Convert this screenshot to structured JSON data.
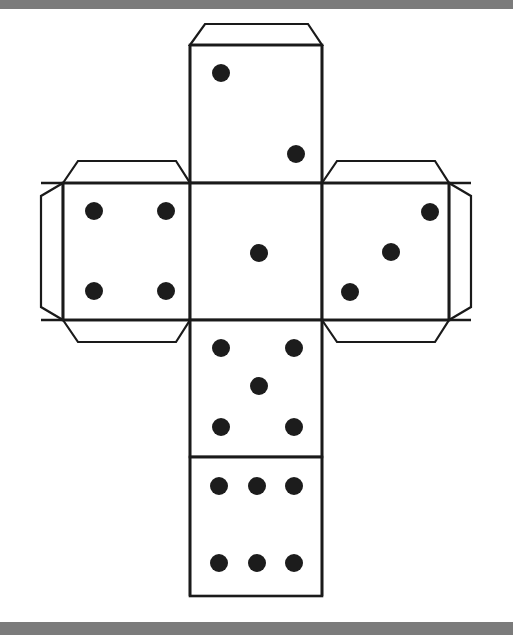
{
  "page": {
    "background_color": "#ffffff",
    "scan_bar_color": "#7b7b7b",
    "ink_color": "#1a1a1a",
    "pip_color": "#1c1c1c",
    "width": 513,
    "height": 635
  },
  "net": {
    "shape": "cube-net-cross",
    "layout": "vertical-column-of-four-with-two-side-faces",
    "stroke_width": 2.4,
    "faces": [
      {
        "id": "face-top",
        "name": "top-face",
        "pip_count": 2,
        "x": 190,
        "y": 45,
        "width": 132,
        "height": 138,
        "pips": [
          {
            "cx": 221,
            "cy": 73,
            "r": 9
          },
          {
            "cx": 296,
            "cy": 154,
            "r": 9
          }
        ]
      },
      {
        "id": "face-left",
        "name": "left-face",
        "pip_count": 4,
        "x": 63,
        "y": 183,
        "width": 127,
        "height": 137,
        "pips": [
          {
            "cx": 94,
            "cy": 211,
            "r": 9
          },
          {
            "cx": 166,
            "cy": 211,
            "r": 9
          },
          {
            "cx": 94,
            "cy": 291,
            "r": 9
          },
          {
            "cx": 166,
            "cy": 291,
            "r": 9
          }
        ]
      },
      {
        "id": "face-center",
        "name": "center-face",
        "pip_count": 1,
        "x": 190,
        "y": 183,
        "width": 132,
        "height": 137,
        "pips": [
          {
            "cx": 259,
            "cy": 253,
            "r": 9
          }
        ]
      },
      {
        "id": "face-right",
        "name": "right-face",
        "pip_count": 3,
        "x": 322,
        "y": 183,
        "width": 127,
        "height": 137,
        "pips": [
          {
            "cx": 430,
            "cy": 212,
            "r": 9
          },
          {
            "cx": 391,
            "cy": 252,
            "r": 9
          },
          {
            "cx": 350,
            "cy": 292,
            "r": 9
          }
        ]
      },
      {
        "id": "face-bottom-five",
        "name": "five-face",
        "pip_count": 5,
        "x": 190,
        "y": 320,
        "width": 132,
        "height": 137,
        "pips": [
          {
            "cx": 221,
            "cy": 348,
            "r": 9
          },
          {
            "cx": 294,
            "cy": 348,
            "r": 9
          },
          {
            "cx": 259,
            "cy": 386,
            "r": 9
          },
          {
            "cx": 221,
            "cy": 427,
            "r": 9
          },
          {
            "cx": 294,
            "cy": 427,
            "r": 9
          }
        ]
      },
      {
        "id": "face-bottom-six",
        "name": "six-face",
        "pip_count": 6,
        "x": 190,
        "y": 457,
        "width": 132,
        "height": 139,
        "pips": [
          {
            "cx": 219,
            "cy": 486,
            "r": 9
          },
          {
            "cx": 257,
            "cy": 486,
            "r": 9
          },
          {
            "cx": 294,
            "cy": 486,
            "r": 9
          },
          {
            "cx": 219,
            "cy": 563,
            "r": 9
          },
          {
            "cx": 257,
            "cy": 563,
            "r": 9
          },
          {
            "cx": 294,
            "cy": 563,
            "r": 9
          }
        ]
      }
    ],
    "flaps": [
      {
        "id": "flap-top",
        "name": "glue-flap-top",
        "points": "190,45 205,24 308,24 322,45"
      },
      {
        "id": "flap-left-top",
        "name": "glue-flap-left-top",
        "points": "63,183 78,161 176,161 190,183"
      },
      {
        "id": "flap-left-outer",
        "name": "glue-flap-left-outer",
        "points": "63,183 41,196 41,307 63,320"
      },
      {
        "id": "flap-left-bottom",
        "name": "glue-flap-left-bottom",
        "points": "63,320 78,342 176,342 190,320"
      },
      {
        "id": "flap-right-top",
        "name": "glue-flap-right-top",
        "points": "322,183 337,161 435,161 449,183"
      },
      {
        "id": "flap-right-outer",
        "name": "glue-flap-right-outer",
        "points": "449,183 471,196 471,307 449,320"
      },
      {
        "id": "flap-right-bottom",
        "name": "glue-flap-right-bottom",
        "points": "322,320 337,342 435,342 449,320"
      }
    ],
    "fold_lines": [
      {
        "name": "fold-top-flap",
        "x1": 190,
        "y1": 45,
        "x2": 322,
        "y2": 45
      },
      {
        "name": "fold-upper-cross",
        "x1": 41,
        "y1": 183,
        "x2": 471,
        "y2": 183
      },
      {
        "name": "fold-lower-cross",
        "x1": 41,
        "y1": 320,
        "x2": 471,
        "y2": 320
      },
      {
        "name": "fold-five-six",
        "x1": 190,
        "y1": 457,
        "x2": 322,
        "y2": 457
      },
      {
        "name": "fold-left-vertical",
        "x1": 63,
        "y1": 183,
        "x2": 63,
        "y2": 320
      },
      {
        "name": "fold-right-vertical",
        "x1": 449,
        "y1": 183,
        "x2": 449,
        "y2": 320
      },
      {
        "name": "fold-column-left",
        "x1": 190,
        "y1": 45,
        "x2": 190,
        "y2": 596
      },
      {
        "name": "fold-column-right",
        "x1": 322,
        "y1": 45,
        "x2": 322,
        "y2": 596
      }
    ]
  }
}
